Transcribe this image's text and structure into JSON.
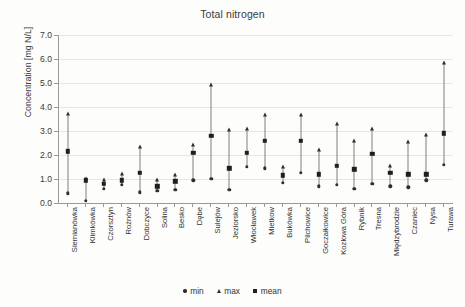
{
  "chart_data": {
    "type": "scatter",
    "title": "Total nitrogen",
    "xlabel": "",
    "ylabel": "Concentration [mg N/L]",
    "ylim": [
      0.0,
      7.0
    ],
    "ytick_labels": [
      "0.0",
      "1.0",
      "2.0",
      "3.0",
      "4.0",
      "5.0",
      "6.0",
      "7.0"
    ],
    "ytick_values": [
      0.0,
      1.0,
      2.0,
      3.0,
      4.0,
      5.0,
      6.0,
      7.0
    ],
    "grid": true,
    "legend_position": "bottom",
    "legend": [
      "min",
      "max",
      "mean"
    ],
    "categories": [
      "Siemianówka",
      "Klimkówka",
      "Czorsztyn",
      "Rożnów",
      "Dobczyce",
      "Solina",
      "Besko",
      "Dębe",
      "Sulejów",
      "Jeziorsko",
      "Włocławek",
      "Mietkow",
      "Bukówka",
      "Pilchowice",
      "Goczałkowice",
      "Kozłowa Góra",
      "Rybnik",
      "Tresna",
      "Międzybrodzie",
      "Czaniec",
      "Nysa",
      "Turawa"
    ],
    "series": [
      {
        "name": "min",
        "marker": "circle",
        "values": [
          0.4,
          0.1,
          0.6,
          0.75,
          0.45,
          0.5,
          0.55,
          0.95,
          1.0,
          0.55,
          1.5,
          1.45,
          0.85,
          1.25,
          0.7,
          0.75,
          0.6,
          0.8,
          0.7,
          0.65,
          0.95,
          1.6
        ]
      },
      {
        "name": "max",
        "marker": "triangle",
        "values": [
          3.7,
          1.0,
          0.95,
          1.2,
          2.35,
          0.95,
          1.15,
          2.4,
          4.9,
          3.05,
          3.1,
          3.65,
          1.5,
          3.65,
          2.2,
          3.3,
          2.6,
          3.1,
          1.55,
          2.55,
          2.85,
          5.85
        ]
      },
      {
        "name": "mean",
        "marker": "square",
        "values": [
          2.15,
          0.95,
          0.8,
          0.95,
          1.25,
          0.7,
          0.9,
          2.1,
          2.8,
          1.45,
          2.1,
          2.6,
          1.15,
          2.6,
          1.2,
          1.55,
          1.4,
          2.05,
          1.25,
          1.2,
          1.2,
          2.9
        ]
      }
    ]
  }
}
